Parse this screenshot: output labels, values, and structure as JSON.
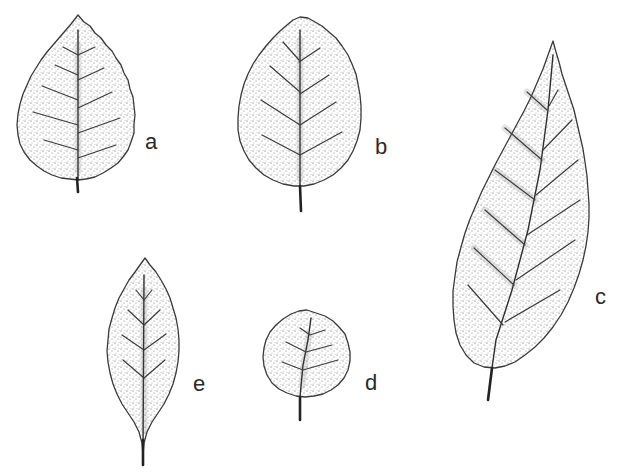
{
  "figure": {
    "type": "botanical-illustration",
    "leaves": [
      {
        "id": "a",
        "label": "a",
        "shape": "ovate, serrate margin"
      },
      {
        "id": "b",
        "label": "b",
        "shape": "broadly elliptic, crenate margin"
      },
      {
        "id": "c",
        "label": "c",
        "shape": "elongate elliptic, serrate margin"
      },
      {
        "id": "d",
        "label": "d",
        "shape": "orbicular, crenate margin"
      },
      {
        "id": "e",
        "label": "e",
        "shape": "lanceolate, serrate margin"
      }
    ],
    "colors": {
      "background": "#ffffff",
      "ink": "#2a2a2a"
    }
  }
}
